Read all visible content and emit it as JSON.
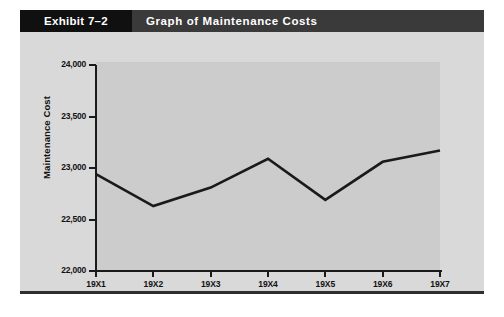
{
  "exhibit": {
    "number_label": "Exhibit 7–2",
    "title": "Graph of Maintenance Costs"
  },
  "colors": {
    "header_number_bg": "#101010",
    "header_title_bg": "#3a3a3a",
    "header_text": "#ffffff",
    "panel_bg": "#d9d9d9",
    "plot_bg": "#cccccc",
    "axis": "#1a1a1a",
    "line": "#1a1a1a",
    "rule": "#2e2e2e"
  },
  "chart_data": {
    "type": "line",
    "title": "Graph of Maintenance Costs",
    "xlabel": "",
    "ylabel": "Maintenance Cost",
    "categories": [
      "19X1",
      "19X2",
      "19X3",
      "19X4",
      "19X5",
      "19X6",
      "19X7"
    ],
    "values": [
      22940,
      22630,
      22810,
      23090,
      22690,
      23060,
      23170
    ],
    "series": [
      {
        "name": "Maintenance Cost",
        "values": [
          22940,
          22630,
          22810,
          23090,
          22690,
          23060,
          23170
        ]
      }
    ],
    "ylim": [
      22000,
      24000
    ],
    "yticks": [
      22000,
      22500,
      23000,
      23500,
      24000
    ],
    "ytick_labels": [
      "22,000",
      "22,500",
      "23,000",
      "23,500",
      "24,000"
    ],
    "xtick_labels": [
      "19X1",
      "19X2",
      "19X3",
      "19X4",
      "19X5",
      "19X6",
      "19X7"
    ],
    "grid": false,
    "legend": "none"
  }
}
